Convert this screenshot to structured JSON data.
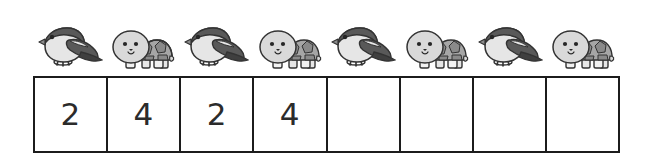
{
  "worksheet": {
    "title": "Alternating pattern counting worksheet",
    "sequence_label": "animal pattern row",
    "grid_label": "answer boxes row"
  },
  "palette": {
    "ink": "#1c1c1c",
    "digit": "#2b2b2b",
    "background": "#ffffff",
    "bird_dark": "#595959",
    "bird_mid": "#8c8c8c",
    "bird_light": "#e6e6e6",
    "bird_outline": "#333333",
    "turtle_head": "#d9d9d9",
    "turtle_shell": "#a6a6a6",
    "turtle_shell_dark": "#8a8a8a",
    "turtle_outline": "#333333"
  },
  "sequence": {
    "count": 8,
    "items": [
      {
        "index": 1,
        "icon": "bird-icon",
        "label": "bird"
      },
      {
        "index": 2,
        "icon": "turtle-icon",
        "label": "turtle"
      },
      {
        "index": 3,
        "icon": "bird-icon",
        "label": "bird"
      },
      {
        "index": 4,
        "icon": "turtle-icon",
        "label": "turtle"
      },
      {
        "index": 5,
        "icon": "bird-icon",
        "label": "bird"
      },
      {
        "index": 6,
        "icon": "turtle-icon",
        "label": "turtle"
      },
      {
        "index": 7,
        "icon": "bird-icon",
        "label": "bird"
      },
      {
        "index": 8,
        "icon": "turtle-icon",
        "label": "turtle"
      }
    ]
  },
  "answer_grid": {
    "count": 8,
    "cells": [
      {
        "index": 1,
        "value": "2",
        "filled": true
      },
      {
        "index": 2,
        "value": "4",
        "filled": true
      },
      {
        "index": 3,
        "value": "2",
        "filled": true
      },
      {
        "index": 4,
        "value": "4",
        "filled": true
      },
      {
        "index": 5,
        "value": "",
        "filled": false
      },
      {
        "index": 6,
        "value": "",
        "filled": false
      },
      {
        "index": 7,
        "value": "",
        "filled": false
      },
      {
        "index": 8,
        "value": "",
        "filled": false
      }
    ]
  }
}
